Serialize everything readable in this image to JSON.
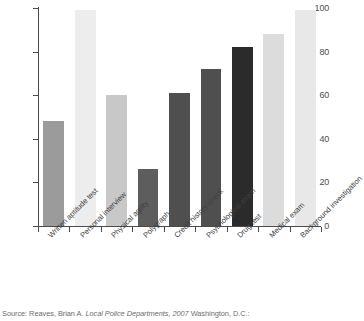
{
  "chart_data": {
    "type": "bar",
    "title": "",
    "xlabel": "",
    "ylabel": "",
    "ylim": [
      0,
      100
    ],
    "yticks": [
      0,
      20,
      40,
      60,
      80,
      100
    ],
    "grid": false,
    "legend": "none",
    "categories": [
      "Written aptitude test",
      "Personal interview",
      "Physical agility",
      "Polygraph",
      "Credit history check",
      "Psychological exam",
      "Drug test",
      "Medical exam",
      "Background investigation"
    ],
    "values": [
      48,
      99,
      60,
      26,
      61,
      72,
      82,
      88,
      99
    ],
    "bar_colors": [
      "#9b9b9b",
      "#ededed",
      "#c8c8c8",
      "#5d5d5d",
      "#4f4f4f",
      "#4f4f4f",
      "#2b2b2b",
      "#dcdcdc",
      "#e8e8e8"
    ]
  },
  "axis": {
    "tick_labels": [
      "0",
      "20",
      "40",
      "60",
      "80",
      "100"
    ]
  },
  "source": {
    "prefix": "Source: Reaves, Brian A. ",
    "italic_title": "Local Police Departments, 2007",
    "suffix": " Washington, D.C.:"
  }
}
